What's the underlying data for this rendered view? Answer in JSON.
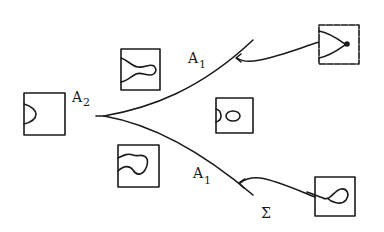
{
  "diagram": {
    "type": "bifurcation-diagram",
    "labels": {
      "cusp": "A",
      "cusp_sub": "2",
      "upper_branch": "A",
      "upper_branch_sub": "1",
      "lower_branch": "A",
      "lower_branch_sub": "1",
      "curve_name": "Σ"
    },
    "colors": {
      "ink": "#1a1a1a",
      "background": "#ffffff"
    },
    "insets": [
      {
        "id": "left",
        "shape": "single-arc",
        "description": "half arc on left edge"
      },
      {
        "id": "top-middle",
        "shape": "tongue",
        "description": "curve forming a rounded protrusion"
      },
      {
        "id": "center",
        "shape": "arc-and-oval",
        "description": "half arc plus separate closed oval"
      },
      {
        "id": "bottom-middle",
        "shape": "bulb",
        "description": "curve with bulbous rounded loop"
      },
      {
        "id": "top-right",
        "shape": "cusp-point",
        "description": "two curves meeting at a point"
      },
      {
        "id": "bottom-right",
        "shape": "loop",
        "description": "self-intersecting teardrop loop"
      }
    ]
  }
}
